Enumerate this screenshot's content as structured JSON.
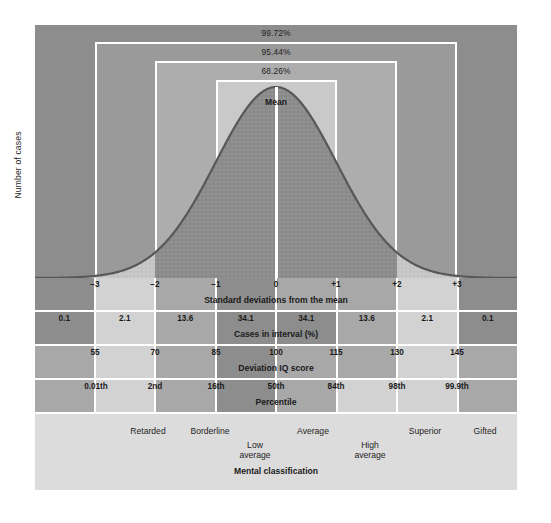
{
  "axis": {
    "y_label": "Number of cases"
  },
  "bands": {
    "sd3_label": "99.72%",
    "sd2_label": "95.44%",
    "sd1_label": "68.26%"
  },
  "curve": {
    "mean_label": "Mean",
    "curve_color": "#5a5a5a",
    "fill_color": "#8a8a8a"
  },
  "rows": {
    "standard_deviations": {
      "caption": "Standard deviations from the mean",
      "ticks": [
        "−3",
        "−2",
        "−1",
        "0",
        "+1",
        "+2",
        "+3"
      ]
    },
    "cases_in_interval": {
      "caption": "Cases in interval (%)",
      "values": [
        "0.1",
        "2.1",
        "13.6",
        "34.1",
        "34.1",
        "13.6",
        "2.1",
        "0.1"
      ]
    },
    "deviation_iq": {
      "caption": "Deviation IQ score",
      "ticks": [
        "55",
        "70",
        "85",
        "100",
        "115",
        "130",
        "145"
      ]
    },
    "percentile": {
      "caption": "Percentile",
      "ticks": [
        "0.01th",
        "2nd",
        "16th",
        "50th",
        "84th",
        "98th",
        "99.9th"
      ]
    },
    "mental_classification": {
      "caption": "Mental classification",
      "items": [
        {
          "label": "Retarded",
          "left": 78,
          "top": 12
        },
        {
          "label": "Borderline",
          "left": 140,
          "top": 12
        },
        {
          "label": "Low\naverage",
          "left": 185,
          "top": 26
        },
        {
          "label": "Average",
          "left": 243,
          "top": 12
        },
        {
          "label": "High\naverage",
          "left": 300,
          "top": 26
        },
        {
          "label": "Superior",
          "left": 355,
          "top": 12
        },
        {
          "label": "Gifted",
          "left": 415,
          "top": 12
        }
      ]
    }
  },
  "chart_data": {
    "type": "line",
    "title": "",
    "xlabel": "Standard deviations from the mean",
    "ylabel": "Number of cases",
    "distribution": "normal",
    "x": [
      -4,
      -3.5,
      -3,
      -2.5,
      -2,
      -1.5,
      -1,
      -0.5,
      0,
      0.5,
      1,
      1.5,
      2,
      2.5,
      3,
      3.5,
      4
    ],
    "y": [
      0.0001,
      0.0009,
      0.0044,
      0.0175,
      0.054,
      0.1295,
      0.242,
      0.3521,
      0.3989,
      0.3521,
      0.242,
      0.1295,
      0.054,
      0.0175,
      0.0044,
      0.0009,
      0.0001
    ],
    "xlim": [
      -4,
      4
    ],
    "ylim": [
      0,
      0.42
    ],
    "grid": false,
    "legend": "none",
    "annotations": [
      "99.72%",
      "95.44%",
      "68.26%",
      "Mean"
    ],
    "interval_percentages": [
      0.1,
      2.1,
      13.6,
      34.1,
      34.1,
      13.6,
      2.1,
      0.1
    ],
    "sd_ticks": [
      -3,
      -2,
      -1,
      0,
      1,
      2,
      3
    ],
    "iq_ticks": [
      55,
      70,
      85,
      100,
      115,
      130,
      145
    ],
    "percentile_ticks": [
      "0.01th",
      "2nd",
      "16th",
      "50th",
      "84th",
      "98th",
      "99.9th"
    ],
    "classifications": [
      "Retarded",
      "Borderline",
      "Low average",
      "Average",
      "High average",
      "Superior",
      "Gifted"
    ],
    "cumulative_band_coverage": {
      "1sd": 68.26,
      "2sd": 95.44,
      "3sd": 99.72
    }
  }
}
